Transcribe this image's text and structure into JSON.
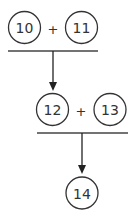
{
  "diagram": {
    "colors": {
      "stroke": "#333333",
      "background": "#ffffff"
    },
    "step1": {
      "left": {
        "value": "10"
      },
      "operator": "+",
      "right": {
        "value": "11"
      }
    },
    "step2": {
      "left": {
        "value": "12"
      },
      "operator": "+",
      "right": {
        "value": "13"
      }
    },
    "result": {
      "value": "14"
    }
  }
}
